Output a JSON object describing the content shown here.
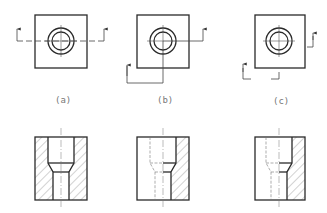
{
  "figure": {
    "views": [
      {
        "id": "a",
        "label": "(a)",
        "cutting_plane": "full section (straight)",
        "section": "full section"
      },
      {
        "id": "b",
        "label": "(b)",
        "cutting_plane": "stepped / offset section",
        "section": "half-hatched section"
      },
      {
        "id": "c",
        "label": "(c)",
        "cutting_plane": "stepped section (broken path)",
        "section": "half-hatched section"
      }
    ],
    "colors": {
      "line": "#2a2a2a",
      "hatch": "#555555",
      "label": "#777777",
      "background": "#ffffff"
    }
  }
}
